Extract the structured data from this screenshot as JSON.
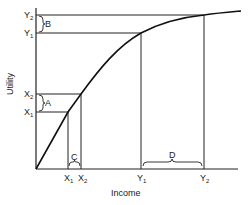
{
  "diagram": {
    "type": "utility-of-income-curve",
    "x_axis_label": "Income",
    "y_axis_label": "Utility",
    "x_ticks": [
      {
        "main": "X",
        "sub": "1"
      },
      {
        "main": "X",
        "sub": "2"
      },
      {
        "main": "Y",
        "sub": "1"
      },
      {
        "main": "Y",
        "sub": "2"
      }
    ],
    "y_ticks": [
      {
        "main": "X",
        "sub": "1"
      },
      {
        "main": "X",
        "sub": "2"
      },
      {
        "main": "Y",
        "sub": "1"
      },
      {
        "main": "Y",
        "sub": "2"
      }
    ],
    "brackets": {
      "A": "A",
      "B": "B",
      "C": "C",
      "D": "D"
    },
    "curve_shape": "concave, diminishing marginal utility"
  }
}
